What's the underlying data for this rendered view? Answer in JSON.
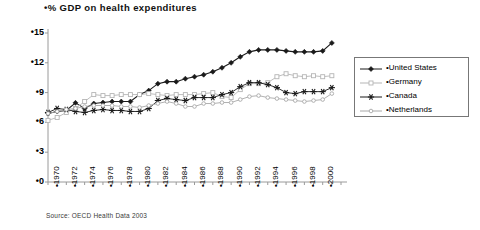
{
  "chart_data": {
    "type": "line",
    "title": "•% GDP on health expenditures",
    "xlabel": "",
    "ylabel": "",
    "ylim": [
      0,
      15
    ],
    "yticks": [
      "•0",
      "•3",
      "•6",
      "•9",
      "•12",
      "•15"
    ],
    "ytick_values": [
      0,
      3,
      6,
      9,
      12,
      15
    ],
    "grid": false,
    "legend_position": "right",
    "source": "Source: OECD Health Data 2003",
    "x": [
      1970,
      1971,
      1972,
      1973,
      1974,
      1975,
      1976,
      1977,
      1978,
      1979,
      1980,
      1981,
      1982,
      1983,
      1984,
      1985,
      1986,
      1987,
      1988,
      1989,
      1990,
      1991,
      1992,
      1993,
      1994,
      1995,
      1996,
      1997,
      1998,
      1999,
      2000,
      2001
    ],
    "xtick_labels": [
      "•1970",
      "•1972",
      "•1974",
      "•1976",
      "•1978",
      "•1980",
      "•1982",
      "•1984",
      "•1986",
      "•1988",
      "•1990",
      "•1992",
      "•1994",
      "•1996",
      "•1998",
      "•2000"
    ],
    "xtick_values": [
      1970,
      1972,
      1974,
      1976,
      1978,
      1980,
      1982,
      1984,
      1986,
      1988,
      1990,
      1992,
      1994,
      1996,
      1998,
      2000
    ],
    "series": [
      {
        "name": "•United States",
        "marker": "filled-diamond",
        "color": "#1a1a1a",
        "values": [
          6.9,
          7.1,
          7.2,
          7.967,
          7.4,
          7.9,
          8.0,
          8.1,
          8.1,
          8.1,
          8.8,
          9.2,
          9.9,
          10.1,
          10.1,
          10.4,
          10.6,
          10.8,
          11.1,
          11.5,
          12.0,
          12.6,
          13.1,
          13.3,
          13.3,
          13.3,
          13.2,
          13.1,
          13.1,
          13.1,
          13.2,
          14.0
        ]
      },
      {
        "name": "•Germany",
        "marker": "open-square",
        "color": "#b5b5b5",
        "values": [
          6.2,
          6.5,
          7.0,
          7.4,
          8.1,
          8.8,
          8.7,
          8.7,
          8.8,
          8.8,
          8.8,
          8.9,
          8.8,
          8.7,
          8.8,
          8.8,
          8.8,
          8.9,
          9.0,
          8.6,
          8.5,
          9.3,
          9.9,
          9.9,
          10.0,
          10.6,
          10.9,
          10.7,
          10.6,
          10.7,
          10.6,
          10.7
        ]
      },
      {
        "name": "•Canada",
        "marker": "star",
        "color": "#1a1a1a",
        "values": [
          7.0,
          7.4,
          7.3,
          7.1,
          7.0,
          7.2,
          7.3,
          7.2,
          7.2,
          7.1,
          7.1,
          7.4,
          8.2,
          8.4,
          8.3,
          8.2,
          8.5,
          8.5,
          8.5,
          8.8,
          9.0,
          9.6,
          10.0,
          10.0,
          9.8,
          9.5,
          9.0,
          8.9,
          9.1,
          9.1,
          9.1,
          9.5
        ]
      },
      {
        "name": "•Netherlands",
        "marker": "open-circle",
        "color": "#a8a8a8",
        "values": [
          6.9,
          7.1,
          7.3,
          7.4,
          7.6,
          7.7,
          7.7,
          7.7,
          7.6,
          7.6,
          7.5,
          7.7,
          7.9,
          8.1,
          7.9,
          7.6,
          7.6,
          7.9,
          7.9,
          8.0,
          8.0,
          8.3,
          8.6,
          8.7,
          8.5,
          8.4,
          8.3,
          8.2,
          8.1,
          8.2,
          8.3,
          8.9
        ]
      }
    ]
  },
  "legend": {
    "entries": [
      {
        "label": "•United States"
      },
      {
        "label": "•Germany"
      },
      {
        "label": "•Canada"
      },
      {
        "label": "•Netherlands"
      }
    ]
  }
}
